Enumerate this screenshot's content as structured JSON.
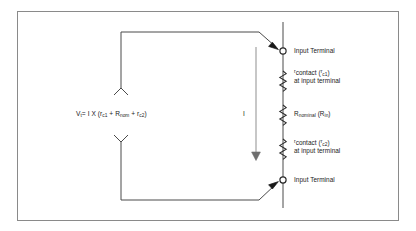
{
  "figure": {
    "border_color": "#8a8a8a",
    "wire_color": "#4a4a4a",
    "text_color": "#1a1a1a",
    "background": "#ffffff"
  },
  "equation": {
    "text": "Vt = I X (rc1 + Rnom + rc2)",
    "lhs_symbol": "V",
    "lhs_subscript": "t",
    "equals": "=",
    "current_symbol": "I",
    "times": "X",
    "open_paren": "(",
    "term1_symbol": "r",
    "term1_subscript": "c1",
    "plus1": "+",
    "term2_symbol": "R",
    "term2_subscript": "nom",
    "plus2": "+",
    "term3_symbol": "r",
    "term3_subscript": "c2",
    "close_paren": ")"
  },
  "current": {
    "label": "I",
    "direction": "down"
  },
  "terminals": [
    {
      "id": "top",
      "label": "Input Terminal"
    },
    {
      "id": "bottom",
      "label": "Input Terminal"
    }
  ],
  "components": [
    {
      "id": "rc1",
      "type": "resistor",
      "symbol": "r",
      "symbol_sub": "contact",
      "paren_symbol": "r",
      "paren_sub": "c1",
      "line1_prefix": "r",
      "line1_main": "contact",
      "line1_paren_open": " (",
      "line1_paren_sym": "r",
      "line1_paren_sub": "c1",
      "line1_paren_close": ")",
      "line2": "at input terminal"
    },
    {
      "id": "rnom",
      "type": "resistor",
      "symbol": "R",
      "symbol_sub": "nominal",
      "paren_symbol": "R",
      "paren_sub": "in",
      "line1_prefix": "R",
      "line1_main": "nominal",
      "line1_paren_open": " (",
      "line1_paren_sym": "R",
      "line1_paren_sub": "in",
      "line1_paren_close": ")",
      "line2": ""
    },
    {
      "id": "rc2",
      "type": "resistor",
      "symbol": "r",
      "symbol_sub": "contact",
      "paren_symbol": "r",
      "paren_sub": "c2",
      "line1_prefix": "r",
      "line1_main": "contact",
      "line1_paren_open": " (",
      "line1_paren_sym": "r",
      "line1_paren_sub": "c2",
      "line1_paren_close": ")",
      "line2": "at input terminal"
    }
  ]
}
